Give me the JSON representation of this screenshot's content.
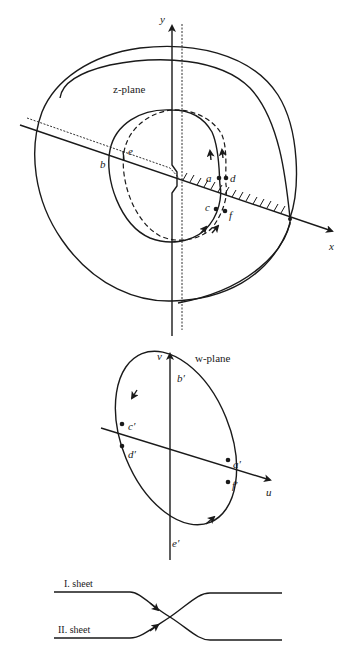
{
  "z_plane": {
    "title": "z-plane",
    "axis_x": "x",
    "axis_y": "y",
    "points": {
      "a": "a",
      "b": "b",
      "c": "c",
      "d": "d",
      "e": "e",
      "f": "f"
    }
  },
  "w_plane": {
    "title": "w-plane",
    "axis_u": "u",
    "axis_v": "v",
    "points": {
      "a": "a′",
      "b": "b′",
      "c": "c′",
      "d": "d′",
      "e": "e′",
      "f": "f′"
    }
  },
  "sheets": {
    "first": "I. sheet",
    "second": "II. sheet"
  },
  "colors": {
    "ink": "#1a1a1a",
    "background": "#ffffff"
  }
}
